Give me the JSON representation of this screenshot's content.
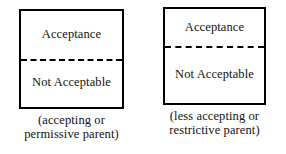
{
  "figure": {
    "background_color": "#ffffff",
    "line_color": "#000000",
    "text_color": "#111111",
    "panels": [
      {
        "id": "accepting-permissive-parent",
        "upper_region_label": "Acceptance",
        "divider_style": "dashed",
        "lower_region_label": "Not\nAcceptable",
        "caption": "(accepting or\npermissive parent)"
      },
      {
        "id": "less-accepting-restrictive-parent",
        "upper_region_label": "Acceptance",
        "divider_style": "dashed",
        "lower_region_label": "Not\nAcceptable",
        "caption": "(less accepting or\nrestrictive parent)"
      }
    ]
  }
}
